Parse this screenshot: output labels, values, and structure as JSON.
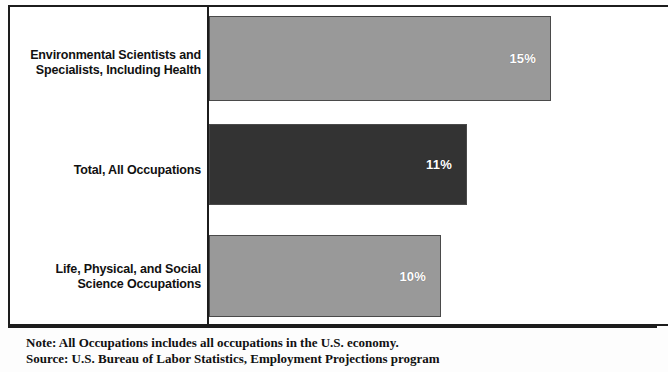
{
  "chart_data": {
    "type": "bar",
    "orientation": "horizontal",
    "title": "",
    "xlabel": "",
    "ylabel": "",
    "categories": [
      "Environmental Scientists and Specialists, Including Health",
      "Total, All Occupations",
      "Life, Physical, and Social Science Occupations"
    ],
    "values": [
      15,
      11,
      10
    ],
    "value_labels": [
      "15%",
      "11%",
      "10%"
    ],
    "xlim": [
      0,
      19.6
    ],
    "grid": false,
    "legend": "none",
    "bar_colors": [
      "#999999",
      "#333333",
      "#999999"
    ],
    "value_label_color": "#ffffff"
  },
  "categories": [
    {
      "line1": "Environmental Scientists and",
      "line2": "Specialists, Including Health"
    },
    {
      "line1": "Total, All Occupations",
      "line2": ""
    },
    {
      "line1": "Life, Physical, and Social",
      "line2": "Science Occupations"
    }
  ],
  "bars": [
    {
      "label": "15%"
    },
    {
      "label": "11%"
    },
    {
      "label": "10%"
    }
  ],
  "footer": {
    "note": "Note: All Occupations includes all occupations in the U.S. economy.",
    "source": "Source: U.S. Bureau of Labor Statistics, Employment Projections program"
  }
}
